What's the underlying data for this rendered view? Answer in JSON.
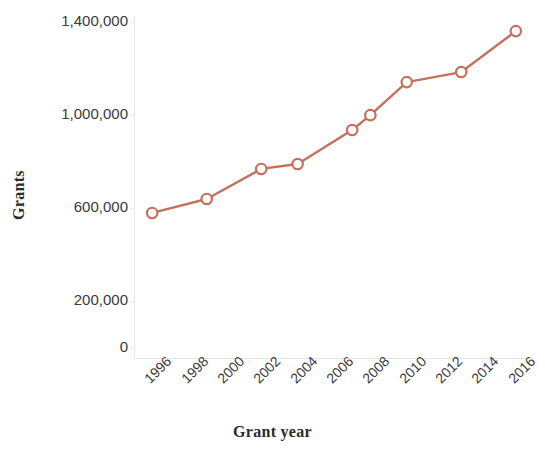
{
  "chart_data": {
    "type": "line",
    "title": "",
    "subtitle": "",
    "xlabel": "Grant year",
    "ylabel": "Grants",
    "x": [
      1996,
      1999,
      2002,
      2004,
      2007,
      2008,
      2010,
      2013,
      2016
    ],
    "categories": [
      "1996",
      "1999",
      "2002",
      "2004",
      "2007",
      "2008",
      "2010",
      "2013",
      "2016"
    ],
    "values": [
      580000,
      640000,
      769000,
      790000,
      936000,
      1000000,
      1142000,
      1185000,
      1361000
    ],
    "series": [
      {
        "name": "Grants",
        "values": [
          580000,
          640000,
          769000,
          790000,
          936000,
          1000000,
          1142000,
          1185000,
          1361000
        ]
      }
    ],
    "xlim": [
      1995,
      2017
    ],
    "ylim": [
      0,
      1400000
    ],
    "ytick_labels": [
      "1,400,000",
      "1,000,000",
      "600,000",
      "200,000",
      "0"
    ],
    "ytick_values": [
      1400000,
      1000000,
      600000,
      200000,
      0
    ],
    "xtick_labels": [
      "1996",
      "1998",
      "2000",
      "2002",
      "2004",
      "2006",
      "2008",
      "2010",
      "2012",
      "2014",
      "2016"
    ],
    "xtick_values": [
      1996,
      1998,
      2000,
      2002,
      2004,
      2006,
      2008,
      2010,
      2012,
      2014,
      2016
    ],
    "grid": false,
    "legend": false,
    "legend_position": "none",
    "marker": "open-circle",
    "line_color": "#c4705e",
    "marker_fill": "#ffffff",
    "axis_color": "#e8e8e8",
    "text_color": "#333333",
    "background_color": "#ffffff",
    "xtick_rotation": -45
  }
}
